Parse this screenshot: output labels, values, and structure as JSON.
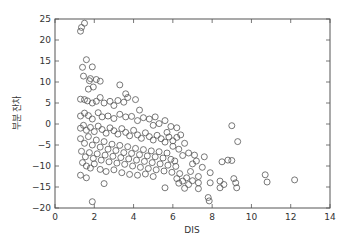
{
  "chart_data": {
    "type": "scatter",
    "title": "",
    "xlabel": "DIS",
    "ylabel": "부분 잔차",
    "xlim": [
      0,
      14
    ],
    "ylim": [
      -20,
      25
    ],
    "xticks": [
      0,
      2,
      4,
      6,
      8,
      10,
      12,
      14
    ],
    "yticks": [
      -20,
      -15,
      -10,
      -5,
      0,
      5,
      10,
      15,
      20,
      25
    ],
    "grid": false,
    "legend": null,
    "marker": {
      "shape": "circle",
      "fill": "none",
      "edge_color": "#555555",
      "radius": 3
    },
    "series": [
      {
        "name": "partial residual",
        "points": [
          [
            1.3,
            22.1
          ],
          [
            1.35,
            23.0
          ],
          [
            1.5,
            24.0
          ],
          [
            1.45,
            11.4
          ],
          [
            1.6,
            15.3
          ],
          [
            1.4,
            13.5
          ],
          [
            1.9,
            13.6
          ],
          [
            1.8,
            10.8
          ],
          [
            1.7,
            8.3
          ],
          [
            1.95,
            8.8
          ],
          [
            1.75,
            10.3
          ],
          [
            2.1,
            10.6
          ],
          [
            2.3,
            10.2
          ],
          [
            3.3,
            9.3
          ],
          [
            3.6,
            7.2
          ],
          [
            3.7,
            6.3
          ],
          [
            1.3,
            5.9
          ],
          [
            1.5,
            5.8
          ],
          [
            1.65,
            5.5
          ],
          [
            1.9,
            5.0
          ],
          [
            2.1,
            5.4
          ],
          [
            2.3,
            6.3
          ],
          [
            2.5,
            5.0
          ],
          [
            2.8,
            5.4
          ],
          [
            3.0,
            4.4
          ],
          [
            3.2,
            5.6
          ],
          [
            3.5,
            5.2
          ],
          [
            4.1,
            5.8
          ],
          [
            4.3,
            3.3
          ],
          [
            1.3,
            1.9
          ],
          [
            1.5,
            2.6
          ],
          [
            1.7,
            2.0
          ],
          [
            1.9,
            1.2
          ],
          [
            2.2,
            2.7
          ],
          [
            2.4,
            1.7
          ],
          [
            2.7,
            1.9
          ],
          [
            3.0,
            1.3
          ],
          [
            3.3,
            2.3
          ],
          [
            3.6,
            1.7
          ],
          [
            3.9,
            1.8
          ],
          [
            4.2,
            0.8
          ],
          [
            4.5,
            1.5
          ],
          [
            4.8,
            1.2
          ],
          [
            5.0,
            -0.3
          ],
          [
            5.3,
            0.1
          ],
          [
            5.6,
            0.8
          ],
          [
            5.9,
            -0.6
          ],
          [
            6.2,
            -0.9
          ],
          [
            5.1,
            1.7
          ],
          [
            1.3,
            -1.0
          ],
          [
            1.45,
            -0.3
          ],
          [
            1.6,
            -1.5
          ],
          [
            1.8,
            -0.8
          ],
          [
            2.0,
            -1.8
          ],
          [
            2.2,
            -0.5
          ],
          [
            2.4,
            -1.3
          ],
          [
            2.6,
            -2.2
          ],
          [
            2.8,
            -0.9
          ],
          [
            3.0,
            -1.6
          ],
          [
            3.2,
            -2.4
          ],
          [
            3.4,
            -1.1
          ],
          [
            3.6,
            -2.0
          ],
          [
            3.8,
            -2.8
          ],
          [
            4.0,
            -1.5
          ],
          [
            4.2,
            -2.6
          ],
          [
            4.4,
            -3.4
          ],
          [
            4.6,
            -2.1
          ],
          [
            4.8,
            -3.0
          ],
          [
            5.0,
            -3.8
          ],
          [
            5.2,
            -2.7
          ],
          [
            5.4,
            -3.5
          ],
          [
            5.6,
            -4.3
          ],
          [
            5.8,
            -3.1
          ],
          [
            6.0,
            -4.0
          ],
          [
            6.2,
            -3.2
          ],
          [
            6.4,
            -2.6
          ],
          [
            6.6,
            -4.6
          ],
          [
            1.3,
            -3.5
          ],
          [
            1.5,
            -4.6
          ],
          [
            1.7,
            -3.0
          ],
          [
            1.9,
            -5.0
          ],
          [
            2.1,
            -3.8
          ],
          [
            2.3,
            -5.5
          ],
          [
            2.5,
            -4.2
          ],
          [
            2.7,
            -6.0
          ],
          [
            2.9,
            -4.8
          ],
          [
            3.1,
            -6.3
          ],
          [
            3.3,
            -5.1
          ],
          [
            3.5,
            -6.8
          ],
          [
            3.7,
            -5.4
          ],
          [
            3.9,
            -7.0
          ],
          [
            4.1,
            -5.8
          ],
          [
            4.3,
            -7.3
          ],
          [
            4.5,
            -6.1
          ],
          [
            4.7,
            -7.6
          ],
          [
            4.9,
            -6.4
          ],
          [
            5.1,
            -7.8
          ],
          [
            5.3,
            -6.6
          ],
          [
            5.5,
            -8.1
          ],
          [
            5.7,
            -6.9
          ],
          [
            5.9,
            -8.4
          ],
          [
            1.35,
            -6.5
          ],
          [
            1.55,
            -7.8
          ],
          [
            1.75,
            -6.8
          ],
          [
            1.95,
            -8.2
          ],
          [
            2.15,
            -7.1
          ],
          [
            2.35,
            -8.6
          ],
          [
            2.55,
            -7.4
          ],
          [
            2.75,
            -9.0
          ],
          [
            2.95,
            -7.7
          ],
          [
            3.15,
            -9.3
          ],
          [
            3.35,
            -8.0
          ],
          [
            3.55,
            -9.6
          ],
          [
            3.75,
            -8.3
          ],
          [
            3.95,
            -10.0
          ],
          [
            4.15,
            -8.6
          ],
          [
            4.35,
            -10.3
          ],
          [
            4.55,
            -8.9
          ],
          [
            4.75,
            -10.6
          ],
          [
            4.95,
            -9.2
          ],
          [
            5.15,
            -10.9
          ],
          [
            5.35,
            -9.5
          ],
          [
            5.55,
            -11.2
          ],
          [
            5.75,
            -9.8
          ],
          [
            5.95,
            -11.5
          ],
          [
            6.15,
            -10.1
          ],
          [
            6.35,
            -11.8
          ],
          [
            1.4,
            -9.2
          ],
          [
            1.6,
            -10.0
          ],
          [
            1.8,
            -10.5
          ],
          [
            2.0,
            -9.5
          ],
          [
            2.3,
            -10.8
          ],
          [
            2.6,
            -11.3
          ],
          [
            3.0,
            -10.9
          ],
          [
            3.4,
            -11.6
          ],
          [
            3.8,
            -12.0
          ],
          [
            4.2,
            -12.2
          ],
          [
            4.6,
            -11.9
          ],
          [
            5.0,
            -12.5
          ],
          [
            1.3,
            -12.2
          ],
          [
            1.6,
            -12.8
          ],
          [
            2.5,
            -14.2
          ],
          [
            1.9,
            -18.5
          ],
          [
            5.6,
            -15.2
          ],
          [
            6.2,
            -13.0
          ],
          [
            6.3,
            -14.1
          ],
          [
            6.5,
            -13.6
          ],
          [
            6.6,
            -15.3
          ],
          [
            6.7,
            -12.8
          ],
          [
            6.8,
            -14.4
          ],
          [
            7.0,
            -13.5
          ],
          [
            7.3,
            -14.0
          ],
          [
            7.3,
            -15.4
          ],
          [
            7.3,
            -12.5
          ],
          [
            7.0,
            -9.5
          ],
          [
            7.2,
            -8.8
          ],
          [
            7.5,
            -10.3
          ],
          [
            7.6,
            -7.8
          ],
          [
            7.9,
            -11.6
          ],
          [
            7.9,
            -14.0
          ],
          [
            7.8,
            -17.5
          ],
          [
            7.85,
            -18.3
          ],
          [
            8.4,
            -13.6
          ],
          [
            8.4,
            -15.2
          ],
          [
            8.6,
            -14.4
          ],
          [
            9.1,
            -13.0
          ],
          [
            9.2,
            -14.0
          ],
          [
            9.25,
            -15.2
          ],
          [
            8.5,
            -9.0
          ],
          [
            8.8,
            -8.6
          ],
          [
            9.0,
            -8.7
          ],
          [
            9.0,
            -0.4
          ],
          [
            9.3,
            -4.2
          ],
          [
            10.7,
            -12.1
          ],
          [
            10.8,
            -13.8
          ],
          [
            12.2,
            -13.3
          ],
          [
            6.5,
            -7.5
          ],
          [
            6.8,
            -6.9
          ],
          [
            7.1,
            -7.4
          ],
          [
            6.0,
            -5.3
          ],
          [
            6.3,
            -6.0
          ],
          [
            5.7,
            -2.0
          ],
          [
            6.1,
            -8.8
          ],
          [
            6.9,
            -11.3
          ]
        ]
      }
    ]
  }
}
